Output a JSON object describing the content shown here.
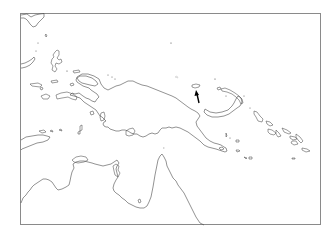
{
  "map": {
    "region": "New Guinea and surrounding islands",
    "style": "outline",
    "background_color": "#ffffff",
    "coast_color": "#4a4a4a",
    "frame_color": "#8a8a8a",
    "marker": {
      "type": "arrow",
      "icon": "arrow-up-icon",
      "color": "#000000",
      "points_to": "small island north of New Guinea"
    }
  }
}
